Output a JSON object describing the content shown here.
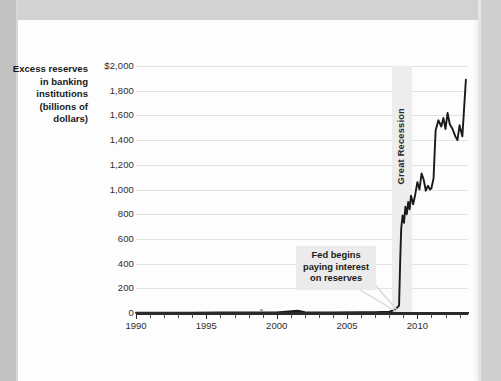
{
  "chart_data": {
    "type": "line",
    "title": "",
    "subtitle": "",
    "xlabel": "",
    "ylabel": "Excess reserves in banking institutions (billions of dollars)",
    "ylabel_lines": [
      "Excess reserves",
      "in banking",
      "institutions",
      "(billions of",
      "dollars)"
    ],
    "xlim": [
      1990,
      2013.6
    ],
    "ylim": [
      0,
      2000
    ],
    "y_tick_values": [
      0,
      200,
      400,
      600,
      800,
      1000,
      1200,
      1400,
      1600,
      1800,
      2000
    ],
    "y_tick_labels": [
      "0",
      "200",
      "400",
      "600",
      "800",
      "1,000",
      "1,200",
      "1,400",
      "1,600",
      "1,800",
      "$2,000"
    ],
    "x_tick_values": [
      1990,
      1995,
      2000,
      2005,
      2010
    ],
    "x_tick_labels": [
      "1990",
      "1995",
      "2000",
      "2005",
      "2010"
    ],
    "x_minor_step": 1,
    "grid": "horizontal",
    "legend": "none",
    "line_color": "#1a1a1a",
    "grid_color": "#e3e3e3",
    "axis_color": "#2b2b2b",
    "band_color": "#ececec",
    "callout_bg": "#ebebeb",
    "series": [
      {
        "name": "Excess reserves",
        "x": [
          1990.0,
          1992.0,
          1994.0,
          1996.0,
          1998.0,
          2000.0,
          2001.5,
          2002.0,
          2004.0,
          2006.0,
          2007.0,
          2008.0,
          2008.4,
          2008.7,
          2008.78,
          2008.85,
          2008.95,
          2009.05,
          2009.15,
          2009.25,
          2009.35,
          2009.45,
          2009.55,
          2009.7,
          2009.85,
          2010.0,
          2010.15,
          2010.3,
          2010.45,
          2010.6,
          2010.75,
          2010.9,
          2011.0,
          2011.15,
          2011.3,
          2011.5,
          2011.7,
          2011.85,
          2012.0,
          2012.15,
          2012.3,
          2012.5,
          2012.7,
          2012.85,
          2013.0,
          2013.2,
          2013.45
        ],
        "y": [
          2,
          3,
          3,
          4,
          5,
          5,
          18,
          6,
          5,
          6,
          7,
          10,
          25,
          60,
          420,
          680,
          790,
          730,
          860,
          800,
          900,
          840,
          950,
          880,
          960,
          1060,
          1000,
          1130,
          1080,
          990,
          1030,
          1000,
          1010,
          1090,
          1480,
          1560,
          1510,
          1580,
          1490,
          1620,
          1530,
          1490,
          1430,
          1400,
          1520,
          1430,
          1890
        ]
      }
    ],
    "annotations": [
      {
        "id": "great-recession",
        "text": "Great Recession",
        "type": "shaded-band-label",
        "band_start": 2008.2,
        "band_end": 2009.6,
        "orientation": "vertical"
      },
      {
        "id": "fed-interest",
        "text": "Fed begins\npaying interest\non reserves",
        "lines": [
          "Fed begins",
          "paying interest",
          "on reserves"
        ],
        "type": "callout-box",
        "points_to_x": 2008.7,
        "points_to_y": 0
      }
    ]
  }
}
